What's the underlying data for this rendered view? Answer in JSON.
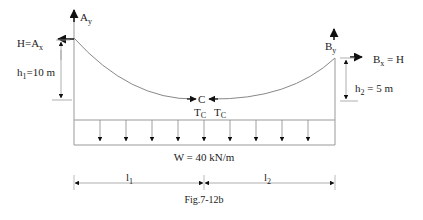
{
  "figure": {
    "caption": "Fig.7-12b",
    "colors": {
      "line": "#7a7a7a",
      "arrow": "#111111",
      "text": "#222222"
    }
  },
  "labels": {
    "ay": "A",
    "ay_sub": "y",
    "h_ax": "H=A",
    "h_ax_sub": "x",
    "h1": "h",
    "h1_sub": "1",
    "h1_val": "=10 m",
    "by": "B",
    "by_sub": "y",
    "bx": "B",
    "bx_sub": "x",
    "bx_val": " = H",
    "h2": "h",
    "h2_sub": "2",
    "h2_val": " = 5 m",
    "c": "C",
    "tc1": "T",
    "tc1_sub": "C",
    "tc2": "T",
    "tc2_sub": "C",
    "load": "W = 40 kN/m",
    "l1": "l",
    "l1_sub": "1",
    "l2": "l",
    "l2_sub": "2"
  }
}
